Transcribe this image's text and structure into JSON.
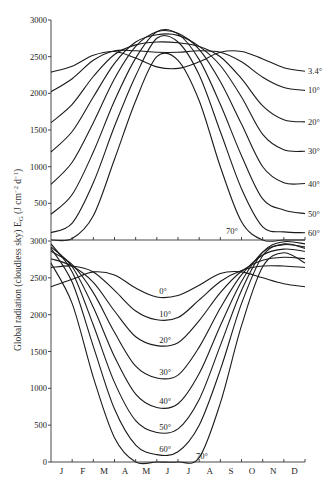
{
  "chart_data": [
    {
      "type": "line",
      "panel": "top",
      "title": "",
      "xlabel": "",
      "ylabel": "Global radiation (cloudless sky) E_G (J cm^-2 d^-1)",
      "ylim": [
        0,
        3000
      ],
      "yticks": [
        3000,
        2500,
        2000,
        1500,
        1000,
        500
      ],
      "grid": false,
      "legend": "inline labels at right edge",
      "x": [
        "J",
        "F",
        "M",
        "A",
        "M",
        "J",
        "J",
        "A",
        "S",
        "O",
        "N",
        "D",
        "J"
      ],
      "series": [
        {
          "name": "3.4°",
          "values": [
            2290,
            2370,
            2520,
            2570,
            2480,
            2360,
            2340,
            2430,
            2560,
            2570,
            2470,
            2350,
            2300
          ]
        },
        {
          "name": "10°",
          "values": [
            2020,
            2200,
            2450,
            2580,
            2580,
            2560,
            2560,
            2580,
            2560,
            2430,
            2220,
            2080,
            2040
          ]
        },
        {
          "name": "20°",
          "values": [
            1600,
            1850,
            2230,
            2530,
            2660,
            2700,
            2690,
            2640,
            2500,
            2200,
            1830,
            1640,
            1610
          ]
        },
        {
          "name": "30°",
          "values": [
            1200,
            1480,
            1950,
            2410,
            2700,
            2800,
            2790,
            2640,
            2380,
            1950,
            1440,
            1230,
            1210
          ]
        },
        {
          "name": "40°",
          "values": [
            760,
            1060,
            1600,
            2200,
            2640,
            2840,
            2820,
            2600,
            2160,
            1580,
            1000,
            780,
            770
          ]
        },
        {
          "name": "50°",
          "values": [
            350,
            620,
            1200,
            1900,
            2480,
            2840,
            2810,
            2460,
            1850,
            1150,
            560,
            410,
            360
          ]
        },
        {
          "name": "60°",
          "values": [
            100,
            230,
            780,
            1550,
            2240,
            2750,
            2700,
            2250,
            1480,
            700,
            180,
            110,
            100
          ]
        },
        {
          "name": "70°",
          "values": [
            0,
            20,
            330,
            1100,
            1900,
            2500,
            2450,
            1900,
            1000,
            250,
            0,
            0,
            0
          ]
        }
      ]
    },
    {
      "type": "line",
      "panel": "bottom",
      "title": "",
      "xlabel": "",
      "ylabel": "Global radiation (cloudless sky) E_G (J cm^-2 d^-1)",
      "ylim": [
        0,
        3000
      ],
      "yticks": [
        3000,
        2500,
        2000,
        1500,
        1000,
        500,
        0
      ],
      "grid": false,
      "legend": "inline labels at curve minima",
      "x": [
        "J",
        "F",
        "M",
        "A",
        "M",
        "J",
        "J",
        "A",
        "S",
        "O",
        "N",
        "D",
        "J"
      ],
      "series": [
        {
          "name": "0°",
          "values": [
            2380,
            2480,
            2580,
            2540,
            2360,
            2240,
            2260,
            2400,
            2560,
            2580,
            2500,
            2420,
            2380
          ]
        },
        {
          "name": "10°",
          "values": [
            2640,
            2660,
            2580,
            2330,
            2050,
            1930,
            1960,
            2200,
            2450,
            2600,
            2660,
            2660,
            2640
          ]
        },
        {
          "name": "20°",
          "values": [
            2760,
            2660,
            2440,
            2050,
            1700,
            1580,
            1620,
            1920,
            2300,
            2590,
            2740,
            2780,
            2760
          ]
        },
        {
          "name": "30°",
          "values": [
            2860,
            2680,
            2300,
            1760,
            1300,
            1140,
            1180,
            1560,
            2090,
            2540,
            2810,
            2890,
            2860
          ]
        },
        {
          "name": "40°",
          "values": [
            2920,
            2650,
            2100,
            1430,
            920,
            740,
            790,
            1200,
            1850,
            2450,
            2850,
            2950,
            2920
          ]
        },
        {
          "name": "50°",
          "values": [
            2960,
            2580,
            1860,
            1080,
            560,
            400,
            450,
            850,
            1580,
            2330,
            2850,
            2990,
            2960
          ]
        },
        {
          "name": "60°",
          "values": [
            2900,
            2440,
            1570,
            720,
            230,
            100,
            140,
            500,
            1250,
            2150,
            2800,
            2960,
            2900
          ]
        },
        {
          "name": "70°",
          "values": [
            2700,
            2150,
            1150,
            330,
            0,
            0,
            0,
            60,
            800,
            1850,
            2650,
            2840,
            2700
          ]
        }
      ]
    }
  ],
  "axes": {
    "ylabel": "Global radiation (cloudless sky) E",
    "ylabel_sub": "G",
    "ylabel_units": " (J cm",
    "ylabel_sup1": "−2",
    "ylabel_mid": " d",
    "ylabel_sup2": "−1",
    "ylabel_end": ")",
    "months": [
      "J",
      "F",
      "M",
      "A",
      "M",
      "J",
      "J",
      "A",
      "S",
      "O",
      "N",
      "D"
    ],
    "top_ticks": [
      "3000",
      "2500",
      "2000",
      "1500",
      "1000",
      "500"
    ],
    "bottom_ticks": [
      "3000",
      "2500",
      "2000",
      "1500",
      "1000",
      "500",
      "0"
    ]
  },
  "labels": {
    "top": [
      "3.4°",
      "10°",
      "20°",
      "30°",
      "40°",
      "50°",
      "60°",
      "70°"
    ],
    "bottom": [
      "0°",
      "10°",
      "20°",
      "30°",
      "40°",
      "50°",
      "60°",
      "70°"
    ]
  }
}
